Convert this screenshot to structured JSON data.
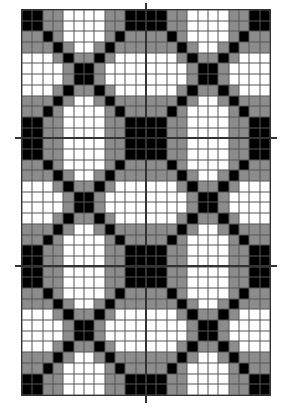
{
  "quilt": {
    "blocks_x": 2,
    "blocks_y": 3,
    "block_width": 124,
    "block_height": 128.3,
    "colors": {
      "B": "#000000",
      "G": "#8c8c8c",
      "W": "#ffffff"
    },
    "block_pattern": [
      "BBGGWWWWGGBB",
      "BBGGWWWWGGBB",
      "GGBGWWWWGBGG",
      "GGGBGWWGBGGG",
      "WWWGBGGBGWWW",
      "WWWWGBBGWWWW",
      "WWWWGBBGWWWW",
      "WWWGBGGBGWWW",
      "GGGBGWWGBGGG",
      "GGBGWWWWGBGG",
      "BBGGWWWWGGBB",
      "BBGGWWWWGGBB"
    ]
  },
  "guides": [
    {
      "type": "vertical",
      "x": 146,
      "y1": 3,
      "y2": 403
    },
    {
      "type": "horizontal",
      "y": 138,
      "x1": 15,
      "x2": 277
    },
    {
      "type": "horizontal",
      "y": 266,
      "x1": 15,
      "x2": 277
    }
  ]
}
